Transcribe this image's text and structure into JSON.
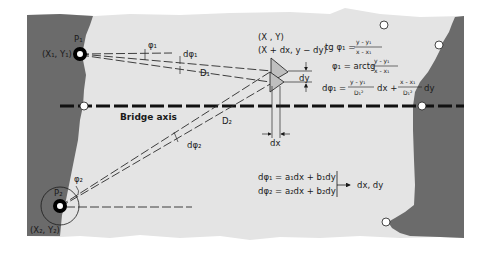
{
  "colors": {
    "paper": "#e4e4e4",
    "bank": "#6b6b6b",
    "ink": "#1a1a1a",
    "background": "#ffffff"
  },
  "stations": {
    "p1": {
      "label": "P₁",
      "coords": "(X₁, Y₁)"
    },
    "p2": {
      "label": "P₂",
      "coords": "(X₂, Y₂)"
    }
  },
  "target": {
    "coords": "(X , Y)",
    "displaced_coords": "(X + dx, y − dy)",
    "dy_label": "dy",
    "dx_label": "dx"
  },
  "angles": {
    "phi1": "φ₁",
    "dphi1": "dφ₁",
    "phi2": "φ₂",
    "dphi2": "dφ₂"
  },
  "distances": {
    "d1": "D₁",
    "d2": "D₂"
  },
  "bridge_axis_label": "Bridge axis",
  "formulas": {
    "f1_left": "tg φ₁ =",
    "f1_num": "y - y₁",
    "f1_den": "x - x₁",
    "f2_left": "φ₁ = arctg",
    "f2_num": "y - y₁",
    "f2_den": "x - x₁",
    "f3_left": "dφ₁ =",
    "f3_num1": "y - y₁",
    "f3_den1": "D₁²",
    "f3_mid": "dx +",
    "f3_num2": "x - x₁",
    "f3_den2": "D₁²",
    "f3_end": "dy"
  },
  "system": {
    "eq1": "dφ₁ = a₁dx + b₁dy",
    "eq2": "dφ₂ = a₂dx + b₂dy",
    "result": "dx, dy"
  }
}
